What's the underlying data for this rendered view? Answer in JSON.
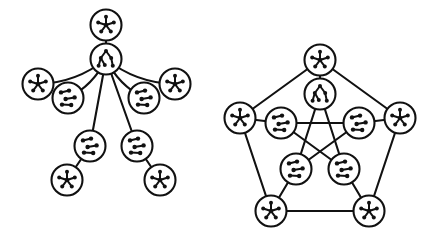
{
  "figure": {
    "background_color": "#ffffff",
    "ink_color": "#111111",
    "width": 428,
    "height": 236,
    "caption": "",
    "panels": [
      {
        "id": "left-panel",
        "name": "tree-of-graphs",
        "layout": "tree",
        "description": "Tree whose vertices are small graphs",
        "node_radius": 15.5,
        "nodes": [
          {
            "id": "L0",
            "icon": "star5",
            "x": 106,
            "y": 25
          },
          {
            "id": "L1",
            "icon": "fan-tree",
            "x": 106,
            "y": 59
          },
          {
            "id": "L2",
            "icon": "star5",
            "x": 38,
            "y": 84
          },
          {
            "id": "L3",
            "icon": "matching",
            "x": 68,
            "y": 98
          },
          {
            "id": "L4",
            "icon": "matching",
            "x": 144,
            "y": 98
          },
          {
            "id": "L5",
            "icon": "star5",
            "x": 175,
            "y": 84
          },
          {
            "id": "L6",
            "icon": "matching",
            "x": 90,
            "y": 146
          },
          {
            "id": "L7",
            "icon": "matching",
            "x": 137,
            "y": 146
          },
          {
            "id": "L8",
            "icon": "star5",
            "x": 67,
            "y": 180
          },
          {
            "id": "L9",
            "icon": "star5",
            "x": 160,
            "y": 180
          }
        ],
        "edges": [
          {
            "from": "L0",
            "to": "L1",
            "kind": "straight"
          },
          {
            "from": "L1",
            "to": "L2",
            "kind": "arc"
          },
          {
            "from": "L1",
            "to": "L3",
            "kind": "arc"
          },
          {
            "from": "L1",
            "to": "L4",
            "kind": "arc"
          },
          {
            "from": "L1",
            "to": "L5",
            "kind": "arc"
          },
          {
            "from": "L1",
            "to": "L6",
            "kind": "straight"
          },
          {
            "from": "L1",
            "to": "L7",
            "kind": "straight"
          },
          {
            "from": "L6",
            "to": "L8",
            "kind": "straight"
          },
          {
            "from": "L7",
            "to": "L9",
            "kind": "straight"
          }
        ]
      },
      {
        "id": "right-panel",
        "name": "petersen-graph-of-graphs",
        "layout": "petersen",
        "description": "Petersen graph whose vertices are small graphs",
        "node_radius": 15.5,
        "nodes": [
          {
            "id": "O0",
            "icon": "star5",
            "x": 320,
            "y": 60
          },
          {
            "id": "O1",
            "icon": "star5",
            "x": 400,
            "y": 118
          },
          {
            "id": "O2",
            "icon": "star5",
            "x": 369,
            "y": 211
          },
          {
            "id": "O3",
            "icon": "star5",
            "x": 271,
            "y": 211
          },
          {
            "id": "O4",
            "icon": "star5",
            "x": 240,
            "y": 118
          },
          {
            "id": "I0",
            "icon": "fan-tree",
            "x": 320,
            "y": 94
          },
          {
            "id": "I1",
            "icon": "matching",
            "x": 359,
            "y": 123
          },
          {
            "id": "I2",
            "icon": "matching",
            "x": 344,
            "y": 169
          },
          {
            "id": "I3",
            "icon": "matching",
            "x": 296,
            "y": 169
          },
          {
            "id": "I4",
            "icon": "matching",
            "x": 281,
            "y": 123
          }
        ],
        "edges": [
          {
            "from": "O0",
            "to": "O1",
            "kind": "straight"
          },
          {
            "from": "O1",
            "to": "O2",
            "kind": "straight"
          },
          {
            "from": "O2",
            "to": "O3",
            "kind": "straight"
          },
          {
            "from": "O3",
            "to": "O4",
            "kind": "straight"
          },
          {
            "from": "O4",
            "to": "O0",
            "kind": "straight"
          },
          {
            "from": "O0",
            "to": "I0",
            "kind": "straight"
          },
          {
            "from": "O1",
            "to": "I1",
            "kind": "straight"
          },
          {
            "from": "O2",
            "to": "I2",
            "kind": "straight"
          },
          {
            "from": "O3",
            "to": "I3",
            "kind": "straight"
          },
          {
            "from": "O4",
            "to": "I4",
            "kind": "straight"
          },
          {
            "from": "I0",
            "to": "I2",
            "kind": "straight"
          },
          {
            "from": "I2",
            "to": "I4",
            "kind": "straight"
          },
          {
            "from": "I4",
            "to": "I1",
            "kind": "straight"
          },
          {
            "from": "I1",
            "to": "I3",
            "kind": "straight"
          },
          {
            "from": "I3",
            "to": "I0",
            "kind": "straight"
          }
        ]
      }
    ],
    "icon_library": {
      "star5": {
        "label": "star-graph-icon",
        "description": "central vertex joined to five outer vertices",
        "center": [
          0,
          0
        ],
        "dots": [
          [
            0,
            0
          ],
          [
            0,
            -8.2
          ],
          [
            7.8,
            -2.5
          ],
          [
            4.8,
            6.6
          ],
          [
            -4.8,
            6.6
          ],
          [
            -7.8,
            -2.5
          ]
        ],
        "edges": [
          [
            0,
            1
          ],
          [
            0,
            2
          ],
          [
            0,
            3
          ],
          [
            0,
            4
          ],
          [
            0,
            5
          ]
        ],
        "dot_radius": 2.0,
        "hub_radius": 2.3
      },
      "fan-tree": {
        "label": "tree-graph-icon",
        "description": "root vertex with branching children",
        "dots": [
          [
            0,
            -8.0
          ],
          [
            -5.2,
            -1.0
          ],
          [
            5.2,
            -1.0
          ],
          [
            -7.4,
            6.8
          ],
          [
            -1.2,
            6.0
          ],
          [
            6.8,
            6.8
          ]
        ],
        "edges": [
          [
            0,
            1
          ],
          [
            0,
            2
          ],
          [
            1,
            3
          ],
          [
            1,
            4
          ],
          [
            2,
            5
          ]
        ],
        "dot_radius": 2.0
      },
      "matching": {
        "label": "matching-graph-icon",
        "description": "three disjoint edges / short paths",
        "dots": [
          [
            -7.0,
            -5.6
          ],
          [
            1.0,
            -7.4
          ],
          [
            -2.4,
            1.0
          ],
          [
            6.6,
            -0.6
          ],
          [
            -6.0,
            6.6
          ],
          [
            3.2,
            7.0
          ]
        ],
        "edges": [
          [
            0,
            1
          ],
          [
            2,
            3
          ],
          [
            4,
            5
          ]
        ],
        "dot_radius": 2.2
      }
    }
  }
}
